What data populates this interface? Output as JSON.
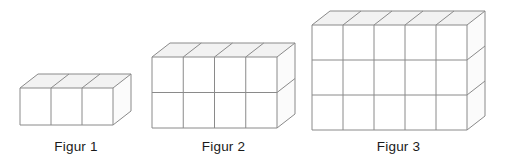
{
  "page": {
    "background_color": "#ffffff",
    "width": 509,
    "height": 164
  },
  "style": {
    "line_color": "#8a8a8a",
    "top_face_color": "#f2f2f2",
    "front_face_color": "#ffffff",
    "side_face_color": "#fbfbfb",
    "label_color": "#1a1a1a"
  },
  "figures": [
    {
      "id": "figure-1",
      "label": "Figur 1",
      "cubes_wide": 3,
      "cubes_high": 1,
      "cubes_deep": 1,
      "total_cubes": 3,
      "origin_x": 20,
      "origin_y": 88,
      "cube_w": 31,
      "cube_h": 37,
      "depth_dx": 18,
      "depth_dy": -14,
      "label_x": 20,
      "label_y": 139,
      "label_w": 112
    },
    {
      "id": "figure-2",
      "label": "Figur 2",
      "cubes_wide": 4,
      "cubes_high": 2,
      "cubes_deep": 1,
      "total_cubes": 8,
      "origin_x": 152,
      "origin_y": 57,
      "cube_w": 31.25,
      "cube_h": 35.5,
      "depth_dx": 18,
      "depth_dy": -14,
      "label_x": 152,
      "label_y": 139,
      "label_w": 143
    },
    {
      "id": "figure-3",
      "label": "Figur 3",
      "cubes_wide": 5,
      "cubes_high": 3,
      "cubes_deep": 1,
      "total_cubes": 15,
      "origin_x": 312,
      "origin_y": 25,
      "cube_w": 31,
      "cube_h": 35,
      "depth_dx": 18,
      "depth_dy": -14,
      "label_x": 312,
      "label_y": 139,
      "label_w": 173
    }
  ]
}
